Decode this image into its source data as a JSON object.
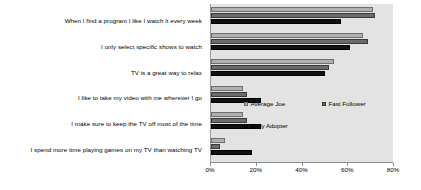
{
  "chart_data": {
    "type": "bar",
    "orientation": "horizontal",
    "title": "",
    "xlabel": "",
    "ylabel": "",
    "xlim": [
      0,
      80
    ],
    "xticks": [
      "0%",
      "20%",
      "40%",
      "60%",
      "80%"
    ],
    "xtick_values": [
      0,
      20,
      40,
      60,
      80
    ],
    "grid": false,
    "legend_position": "inside-right",
    "categories": [
      "When I find a program I like I watch it every week",
      "I only select specific shows to watch",
      "TV is a great way to relax",
      "I like to take my video with me wherever I go",
      "I make sure to keep the TV off most of the time",
      "I spend more time playing games on my TV than watching TV"
    ],
    "series": [
      {
        "name": "Average Joe",
        "color": "#b0b0b0",
        "values": [
          71,
          67,
          54,
          14,
          14,
          6
        ]
      },
      {
        "name": "Fast Follower",
        "color": "#6b6b6b",
        "values": [
          72,
          69,
          52,
          16,
          16,
          4
        ]
      },
      {
        "name": "Early Adopter",
        "color": "#111111",
        "values": [
          57,
          61,
          50,
          22,
          22,
          18
        ]
      }
    ]
  },
  "legend": {
    "entries": [
      {
        "label": "Average Joe"
      },
      {
        "label": "Fast Follower"
      },
      {
        "label": "Early Adopter"
      }
    ]
  },
  "colors": {
    "plot_background": "#e3e3e3",
    "page_background": "#ffffff",
    "axis": "#8c8c8c",
    "text": "#000000"
  }
}
